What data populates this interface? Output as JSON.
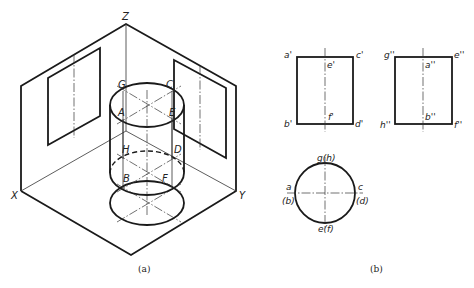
{
  "figure": {
    "panel_a": {
      "caption": "(a)",
      "axes": {
        "x": "X",
        "y": "Y",
        "z": "Z"
      },
      "points": {
        "A": "A",
        "B": "B",
        "C": "C",
        "D": "D",
        "E": "E",
        "F": "F",
        "G": "G",
        "H": "H"
      }
    },
    "panel_b": {
      "caption": "(b)",
      "front_view": {
        "a": "a'",
        "b": "b'",
        "c": "c'",
        "d": "d'",
        "e": "e'",
        "f": "f'"
      },
      "side_view": {
        "g": "g''",
        "a": "a''",
        "e": "e''",
        "h": "h''",
        "b": "b''",
        "f": "f''"
      },
      "top_view": {
        "top": "g(h)",
        "left_a": "a",
        "left_b": "(b)",
        "right_c": "c",
        "right_d": "(d)",
        "bottom": "e(f)"
      }
    },
    "colors": {
      "line": "#1a1a1a",
      "background": "#ffffff"
    }
  }
}
